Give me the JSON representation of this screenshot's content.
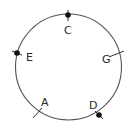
{
  "diagram": {
    "type": "circle-with-labeled-points",
    "circle": {
      "cx": 68.5,
      "cy": 67,
      "r": 53,
      "stroke": "#555555"
    },
    "points": [
      {
        "label": "C",
        "marker": "dot",
        "x": 68,
        "y": 15,
        "label_x": 64,
        "label_y": 34,
        "tick": [
          68,
          10,
          68,
          21
        ]
      },
      {
        "label": "E",
        "marker": "dot",
        "x": 17,
        "y": 53,
        "label_x": 26,
        "label_y": 61,
        "tick": [
          12,
          51,
          22,
          55
        ]
      },
      {
        "label": "G",
        "marker": "tick",
        "x": 114,
        "y": 55,
        "label_x": 102,
        "label_y": 63,
        "tick": [
          109,
          57,
          124,
          51
        ]
      },
      {
        "label": "A",
        "marker": "tick",
        "x": 37,
        "y": 112,
        "label_x": 41,
        "label_y": 106,
        "tick": [
          33,
          118,
          42,
          108
        ]
      },
      {
        "label": "D",
        "marker": "dot",
        "x": 99,
        "y": 115,
        "label_x": 89,
        "label_y": 109,
        "tick": [
          95,
          111,
          103,
          119
        ]
      }
    ]
  }
}
